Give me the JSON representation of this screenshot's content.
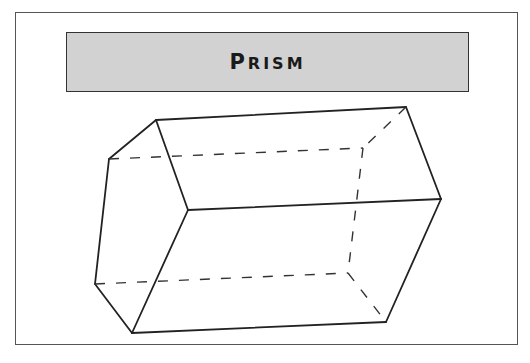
{
  "title": {
    "first_letter": "P",
    "rest": "RISM"
  },
  "colors": {
    "banner_bg": "#d2d2d2",
    "stroke": "#222222",
    "frame": "#555555"
  },
  "diagram": {
    "type": "hexagonal-prism-wireframe",
    "visible_edges": [
      [
        156,
        120,
        406,
        107
      ],
      [
        156,
        120,
        109,
        159
      ],
      [
        156,
        120,
        188,
        210
      ],
      [
        109,
        159,
        95,
        284
      ],
      [
        95,
        284,
        132,
        333
      ],
      [
        132,
        333,
        188,
        210
      ],
      [
        188,
        210,
        441,
        199
      ],
      [
        406,
        107,
        441,
        199
      ],
      [
        441,
        199,
        386,
        322
      ],
      [
        132,
        333,
        386,
        322
      ]
    ],
    "hidden_edges": [
      [
        109,
        159,
        363,
        148
      ],
      [
        406,
        107,
        363,
        148
      ],
      [
        363,
        148,
        348,
        273
      ],
      [
        95,
        284,
        348,
        273
      ],
      [
        348,
        273,
        386,
        322
      ]
    ]
  }
}
